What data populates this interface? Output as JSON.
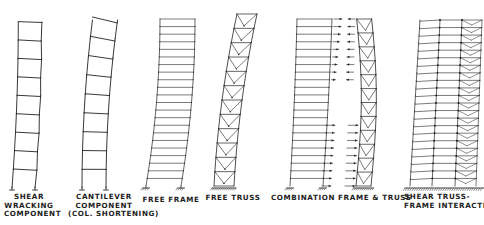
{
  "figure": {
    "ink_color": "#222222",
    "background": "#ffffff"
  },
  "diagrams": [
    {
      "id": "shear-wracking",
      "label_lines": [
        "SHEAR",
        "WRACKING",
        "COMPONENT"
      ],
      "type": "frame",
      "stories": 9,
      "deflection": "shear"
    },
    {
      "id": "cantilever",
      "label_lines": [
        "CANTILEVER",
        "COMPONENT",
        "(COL. SHORTENING)"
      ],
      "type": "frame",
      "stories": 9,
      "deflection": "flexural"
    },
    {
      "id": "free-frame",
      "label_lines": [
        "FREE FRAME"
      ],
      "type": "frame",
      "stories": 22,
      "deflection": "shear"
    },
    {
      "id": "free-truss",
      "label_lines": [
        "FREE TRUSS"
      ],
      "type": "truss",
      "stories": 12,
      "deflection": "flexural"
    },
    {
      "id": "combination",
      "label_lines": [
        "COMBINATION FRAME & TRUSS"
      ],
      "type": "frame+truss with interaction forces",
      "stories": 22
    },
    {
      "id": "shear-truss-frame-interaction",
      "label_lines": [
        "SHEAR TRUSS-",
        "FRAME INTERACTION"
      ],
      "type": "interacting frame and truss",
      "stories": 22
    }
  ]
}
